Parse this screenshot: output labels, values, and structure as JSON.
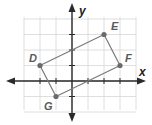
{
  "diagram": {
    "type": "coordinate-plane",
    "axes": {
      "x_label": "x",
      "y_label": "y",
      "x_range": [
        -3,
        4
      ],
      "y_range": [
        -2,
        4
      ],
      "grid": true
    },
    "points": [
      {
        "label": "D",
        "x": -2,
        "y": 1
      },
      {
        "label": "E",
        "x": 2,
        "y": 3
      },
      {
        "label": "F",
        "x": 3,
        "y": 1
      },
      {
        "label": "G",
        "x": -1,
        "y": -1
      }
    ],
    "polygon": [
      "D",
      "E",
      "F",
      "G"
    ],
    "colors": {
      "grid": "#d6d6d6",
      "axis": "#2a2a2a",
      "polygon": "#7a7a7a",
      "point": "#6a6a6a",
      "label": "#5a5a5a"
    }
  }
}
